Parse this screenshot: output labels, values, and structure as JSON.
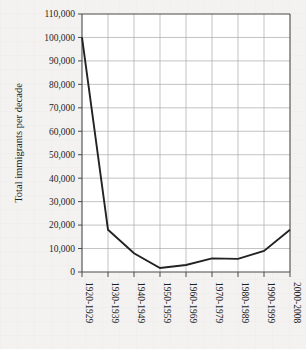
{
  "chart_data": {
    "type": "line",
    "title": "",
    "xlabel": "",
    "ylabel": "Total immigrants per decade",
    "categories": [
      "1920-1929",
      "1930-1939",
      "1940-1949",
      "1950-1959",
      "1960-1969",
      "1970-1979",
      "1980-1989",
      "1990-1999",
      "2000-2008"
    ],
    "values": [
      100000,
      18000,
      8000,
      1700,
      3000,
      5800,
      5600,
      9000,
      18000
    ],
    "series": [
      {
        "name": "Total immigrants per decade",
        "values": [
          100000,
          18000,
          8000,
          1700,
          3000,
          5800,
          5600,
          9000,
          18000
        ]
      }
    ],
    "ylim": [
      0,
      110000
    ],
    "ytick_values": [
      0,
      10000,
      20000,
      30000,
      40000,
      50000,
      60000,
      70000,
      80000,
      90000,
      100000,
      110000
    ],
    "ytick_labels": [
      "0",
      "10,000",
      "20,000",
      "30,000",
      "40,000",
      "50,000",
      "60,000",
      "70,000",
      "80,000",
      "90,000",
      "100,000",
      "110,000"
    ],
    "grid": true,
    "grid_axis": "both",
    "legend": false,
    "legend_position": "none",
    "line_color": "#222222",
    "grid_color": "#a9a9a9",
    "plot_background": "#ffffff",
    "figure_background": "#f3f2f0"
  }
}
